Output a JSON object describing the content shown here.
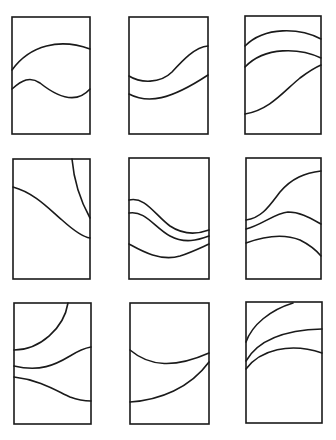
{
  "diagram": {
    "title": "",
    "colors": {
      "stroke": "#1a1a1a",
      "background": "#ffffff"
    },
    "layout": {
      "rows": 3,
      "cols": 3
    },
    "panels": [
      {
        "id": "panel-1",
        "row": 1,
        "col": 1,
        "rect": [
          12,
          17,
          78,
          117
        ],
        "curve_count": 2,
        "curves": [
          "M12 70 C 30 45, 60 38, 90 49",
          "M12 89 C 22 80, 30 76, 40 83 C 55 95, 75 106, 90 89"
        ]
      },
      {
        "id": "panel-2",
        "row": 1,
        "col": 2,
        "rect": [
          129,
          17,
          79,
          117
        ],
        "curve_count": 2,
        "curves": [
          "M129 76 C 140 83, 160 84, 172 72 C 183 60, 195 47, 208 46",
          "M129 94 C 148 104, 170 100, 208 75"
        ]
      },
      {
        "id": "panel-3",
        "row": 1,
        "col": 3,
        "rect": [
          245,
          16,
          76,
          118
        ],
        "curve_count": 3,
        "curves": [
          "M245 46 C 265 26, 300 28, 321 39",
          "M245 67 C 265 46, 300 48, 321 58",
          "M245 114 C 270 110, 285 90, 300 78 C 308 72, 314 68, 321 65"
        ]
      },
      {
        "id": "panel-4",
        "row": 2,
        "col": 1,
        "rect": [
          13,
          159,
          77,
          120
        ],
        "curve_count": 2,
        "curves": [
          "M72 159 C 74 182, 80 200, 90 218",
          "M13 187 C 35 193, 50 210, 62 220 C 72 229, 82 237, 90 238"
        ]
      },
      {
        "id": "panel-5",
        "row": 2,
        "col": 2,
        "rect": [
          129,
          158,
          80,
          121
        ],
        "curve_count": 3,
        "curves": [
          "M129 200 C 145 196, 155 215, 170 226 C 185 236, 198 234, 209 230",
          "M129 213 C 145 210, 155 228, 170 236 C 185 244, 198 240, 209 236",
          "M129 244 C 140 250, 160 262, 180 256 C 192 252, 200 248, 209 244"
        ]
      },
      {
        "id": "panel-6",
        "row": 2,
        "col": 3,
        "rect": [
          246,
          158,
          75,
          121
        ],
        "curve_count": 3,
        "curves": [
          "M246 220 C 262 218, 270 205, 280 192 C 292 178, 305 173, 321 171",
          "M246 229 C 262 225, 275 213, 288 212 C 300 212, 310 218, 321 224",
          "M246 243 C 265 236, 285 234, 300 240 C 310 245, 316 250, 321 256"
        ]
      },
      {
        "id": "panel-7",
        "row": 3,
        "col": 1,
        "rect": [
          14,
          303,
          77,
          121
        ],
        "curve_count": 3,
        "curves": [
          "M68 303 C 64 328, 40 350, 14 350",
          "M14 366 C 40 372, 55 365, 70 356 C 78 351, 85 348, 91 347",
          "M14 377 C 40 380, 55 390, 70 397 C 78 400, 85 401, 91 401"
        ]
      },
      {
        "id": "panel-8",
        "row": 3,
        "col": 2,
        "rect": [
          130,
          303,
          79,
          121
        ],
        "curve_count": 2,
        "curves": [
          "M130 350 C 150 367, 175 368, 209 353",
          "M130 402 C 160 400, 190 388, 209 362"
        ]
      },
      {
        "id": "panel-9",
        "row": 3,
        "col": 3,
        "rect": [
          246,
          302,
          76,
          121
        ],
        "curve_count": 3,
        "curves": [
          "M246 342 C 252 325, 270 310, 293 303",
          "M246 361 C 258 340, 285 330, 322 329",
          "M246 369 C 260 350, 290 342, 322 353"
        ]
      }
    ]
  }
}
